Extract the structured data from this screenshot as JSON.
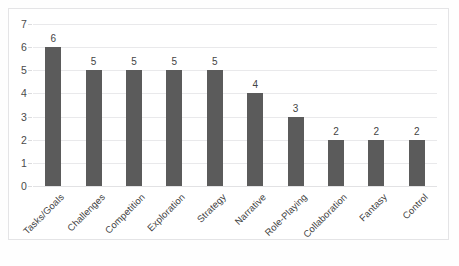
{
  "chart_data": {
    "type": "bar",
    "title": "",
    "subtitle": "",
    "xlabel": "",
    "ylabel": "",
    "categories": [
      "Tasks/Goals",
      "Challenges",
      "Competition",
      "Exploration",
      "Strategy",
      "Narrative",
      "Role-Playing",
      "Collaboration",
      "Fantasy",
      "Control"
    ],
    "values": [
      6,
      5,
      5,
      5,
      5,
      4,
      3,
      2,
      2,
      2
    ],
    "data_labels": [
      "6",
      "5",
      "5",
      "5",
      "5",
      "4",
      "3",
      "2",
      "2",
      "2"
    ],
    "ylim": [
      0,
      7
    ],
    "ytick_labels": [
      "0",
      "1",
      "2",
      "3",
      "4",
      "5",
      "6",
      "7"
    ],
    "ytick_values": [
      0,
      1,
      2,
      3,
      4,
      5,
      6,
      7
    ],
    "grid": true,
    "grid_axis": "y",
    "legend": false,
    "legend_position": "none",
    "bar_color": "#5b5b5b",
    "grid_color": "#e9e9eb",
    "text_color": "#444444",
    "background_color": "#ffffff",
    "border_color": "#e4e4e6"
  }
}
